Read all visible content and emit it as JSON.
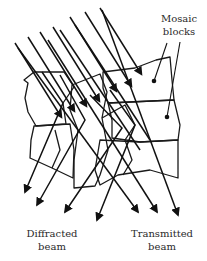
{
  "diagram": {
    "type": "mosaic-crystal-diffraction",
    "labels": {
      "mosaic_line1": "Mosaic",
      "mosaic_line2": "blocks",
      "diffracted_line1": "Diffracted",
      "diffracted_line2": "beam",
      "transmitted_line1": "Transmitted",
      "transmitted_line2": "beam"
    },
    "incident_ray_count": 7,
    "transmitted_ray_count": 3,
    "diffracted_ray_count": 4,
    "colors": {
      "line": "#111111",
      "hatch": "#777777",
      "background": "#ffffff",
      "text": "#2a2a2a"
    }
  }
}
